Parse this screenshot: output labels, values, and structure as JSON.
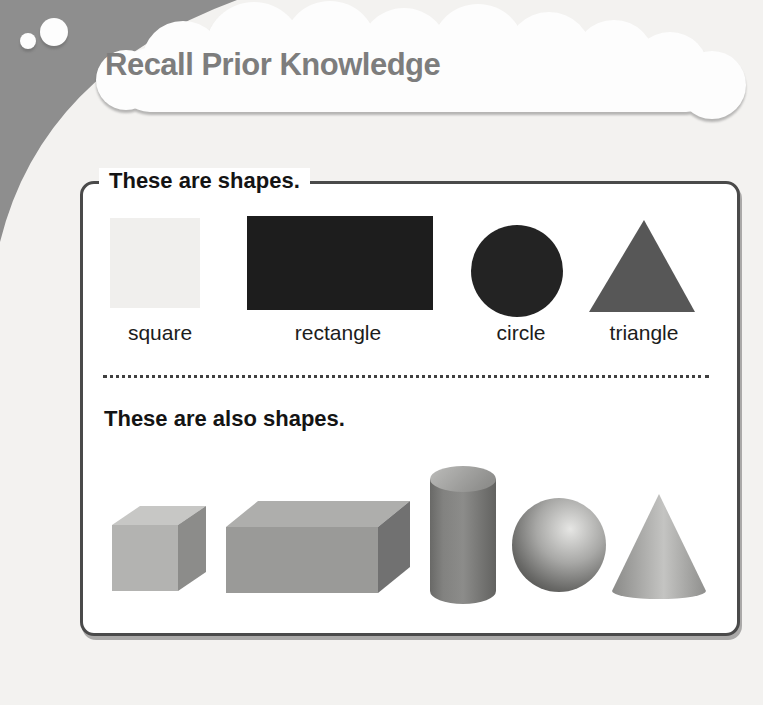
{
  "header": {
    "title": "Recall Prior Knowledge",
    "title_color": "#7d7d7d",
    "bubble": "thought-cloud",
    "bubble_color": "#fdfdfd",
    "blob_color": "#8e8e8e"
  },
  "panel": {
    "border_color": "#4a4a4a",
    "section_2d": {
      "title": "These are shapes.",
      "items": [
        {
          "label": "square",
          "shape": "square",
          "color": "#f0efed"
        },
        {
          "label": "rectangle",
          "shape": "rectangle",
          "color": "#1d1d1d"
        },
        {
          "label": "circle",
          "shape": "circle",
          "color": "#232323"
        },
        {
          "label": "triangle",
          "shape": "triangle",
          "color": "#575757"
        }
      ]
    },
    "section_3d": {
      "title": "These are also shapes.",
      "items": [
        {
          "shape": "cube",
          "colors": {
            "top": "#c7c7c5",
            "front": "#b3b3b1",
            "side": "#8c8c8a"
          }
        },
        {
          "shape": "rectangular-prism",
          "colors": {
            "top": "#aeaeac",
            "front": "#9a9a98",
            "side": "#717171"
          }
        },
        {
          "shape": "cylinder",
          "colors": {
            "top": "#a9a9a7",
            "body": "#7d7d7b"
          }
        },
        {
          "shape": "sphere",
          "colors": {
            "highlight": "#e6e6e4",
            "edge": "#4c4c4a"
          }
        },
        {
          "shape": "cone",
          "colors": {
            "left": "#8a8a88",
            "center": "#c4c4c2",
            "right": "#8f8f8d"
          }
        }
      ]
    }
  }
}
